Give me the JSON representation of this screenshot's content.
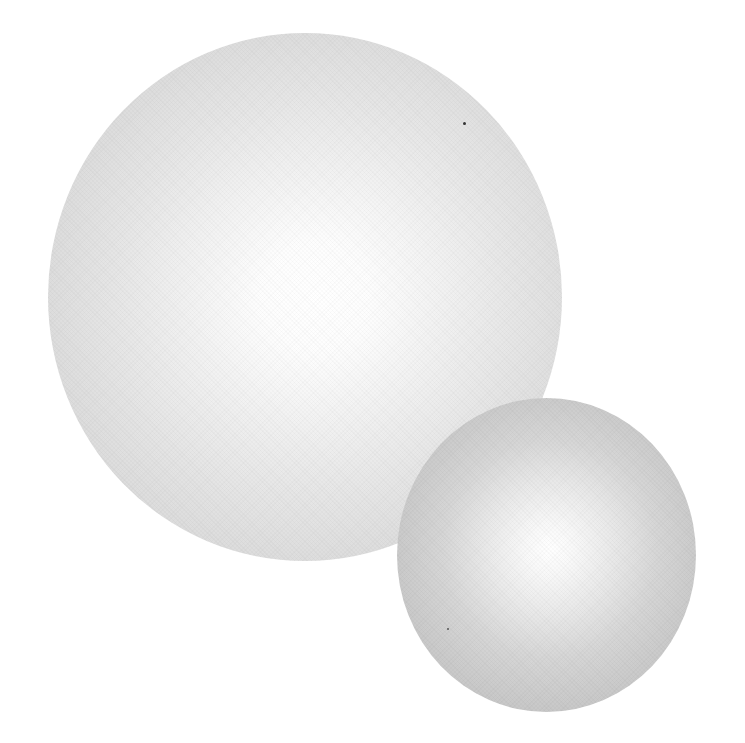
{
  "scene": {
    "background": "#ffffff",
    "description": "Two shaded white spheres, a large one upper-left overlapped by a smaller one lower-right",
    "objects": [
      {
        "name": "large-sphere",
        "center": [
          305,
          297
        ],
        "size": [
          514,
          528
        ],
        "edge_color": "#d6d6d6",
        "highlight_color": "#ffffff"
      },
      {
        "name": "small-sphere",
        "center": [
          546,
          555
        ],
        "size": [
          299,
          314
        ],
        "edge_color": "#c4c4c4",
        "highlight_color": "#ffffff"
      }
    ],
    "specks": [
      {
        "position": [
          464,
          123
        ]
      },
      {
        "position": [
          448,
          629
        ]
      }
    ]
  }
}
